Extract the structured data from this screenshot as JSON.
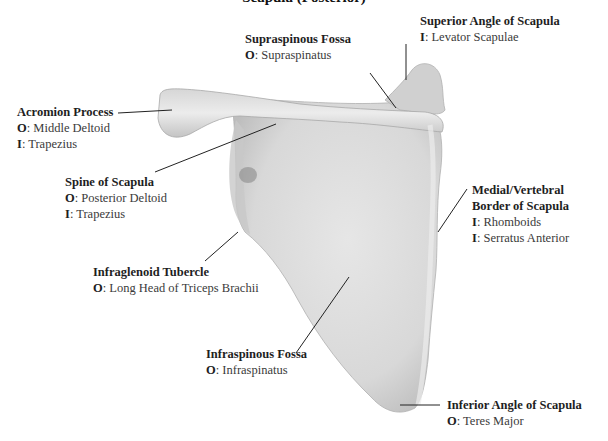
{
  "title": "Scapula (Posterior)",
  "colors": {
    "bone_light": "#ebebeb",
    "bone_mid": "#d9d9d9",
    "bone_dark": "#b8b8b8",
    "leader": "#222222",
    "text": "#3a3a3a"
  },
  "labels": [
    {
      "id": "supraspinous-fossa",
      "name": "Supraspinous Fossa",
      "lines": [
        {
          "key": "O",
          "value": ": Supraspinatus"
        }
      ]
    },
    {
      "id": "superior-angle",
      "name": "Superior Angle of Scapula",
      "lines": [
        {
          "key": "I",
          "value": ": Levator Scapulae"
        }
      ]
    },
    {
      "id": "acromion-process",
      "name": "Acromion Process",
      "lines": [
        {
          "key": "O",
          "value": ": Middle Deltoid"
        },
        {
          "key": "I",
          "value": ": Trapezius"
        }
      ]
    },
    {
      "id": "spine-of-scapula",
      "name": "Spine of Scapula",
      "lines": [
        {
          "key": "O",
          "value": ": Posterior Deltoid"
        },
        {
          "key": "I",
          "value": ": Trapezius"
        }
      ]
    },
    {
      "id": "medial-border",
      "name": "Medial/Vertebral",
      "name2": "Border of Scapula",
      "lines": [
        {
          "key": "I",
          "value": ": Rhomboids"
        },
        {
          "key": "I",
          "value": ": Serratus Anterior"
        }
      ]
    },
    {
      "id": "infraglenoid-tubercle",
      "name": "Infraglenoid Tubercle",
      "lines": [
        {
          "key": "O",
          "value": ": Long Head of Triceps Brachii"
        }
      ]
    },
    {
      "id": "infraspinous-fossa",
      "name": "Infraspinous Fossa",
      "lines": [
        {
          "key": "O",
          "value": ": Infraspinatus"
        }
      ]
    },
    {
      "id": "inferior-angle",
      "name": "Inferior Angle of Scapula",
      "lines": [
        {
          "key": "O",
          "value": ": Teres Major"
        }
      ]
    }
  ]
}
